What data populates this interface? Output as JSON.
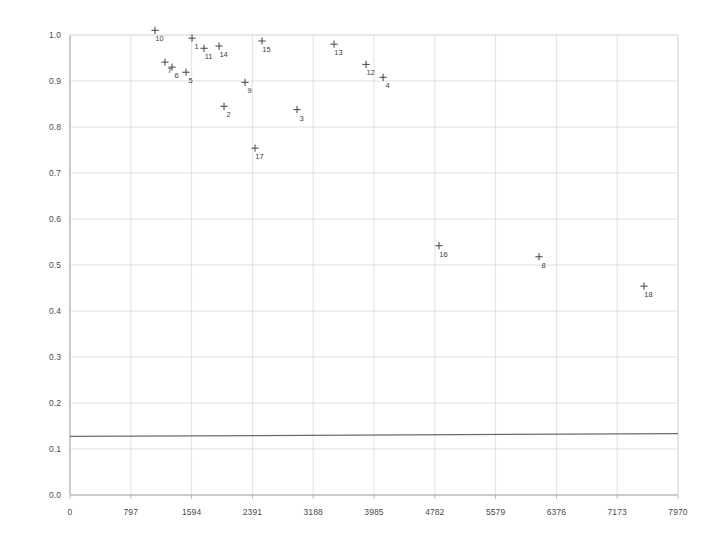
{
  "chart_data": {
    "type": "scatter",
    "title": "",
    "subtitle": "",
    "xlabel": "",
    "ylabel": "",
    "xlim": [
      0,
      7970
    ],
    "ylim": [
      0.0,
      1.0
    ],
    "xticks": [
      0,
      797,
      1594,
      2391,
      3188,
      3985,
      4782,
      5579,
      6376,
      7173,
      7970
    ],
    "xtick_labels": [
      "0",
      "797",
      "1594",
      "2391",
      "3188",
      "3985",
      "4782",
      "5579",
      "6376",
      "7173",
      "7970"
    ],
    "yticks": [
      0.0,
      0.1,
      0.2,
      0.3,
      0.4,
      0.5,
      0.6,
      0.7,
      0.8,
      0.9,
      1.0
    ],
    "ytick_labels": [
      "0.0",
      "0.1",
      "0.2",
      "0.3",
      "0.4",
      "0.5",
      "0.6",
      "0.7",
      "0.8",
      "0.9",
      "1.0"
    ],
    "grid": true,
    "legend": null,
    "marker": "plus",
    "marker_color": "#555555",
    "points": [
      {
        "label": "10",
        "x": 1114,
        "y": 1.01
      },
      {
        "label": "1",
        "x": 1600,
        "y": 0.993
      },
      {
        "label": "11",
        "x": 1757,
        "y": 0.971
      },
      {
        "label": "14",
        "x": 1954,
        "y": 0.976
      },
      {
        "label": "7",
        "x": 1245,
        "y": 0.941
      },
      {
        "label": "6",
        "x": 1337,
        "y": 0.93
      },
      {
        "label": "5",
        "x": 1521,
        "y": 0.919
      },
      {
        "label": "9",
        "x": 2294,
        "y": 0.897
      },
      {
        "label": "2",
        "x": 2019,
        "y": 0.845
      },
      {
        "label": "15",
        "x": 2517,
        "y": 0.987
      },
      {
        "label": "13",
        "x": 3461,
        "y": 0.98
      },
      {
        "label": "12",
        "x": 3881,
        "y": 0.936
      },
      {
        "label": "4",
        "x": 4104,
        "y": 0.908
      },
      {
        "label": "3",
        "x": 2976,
        "y": 0.838
      },
      {
        "label": "17",
        "x": 2425,
        "y": 0.754
      },
      {
        "label": "16",
        "x": 4837,
        "y": 0.542
      },
      {
        "label": "8",
        "x": 6148,
        "y": 0.518
      },
      {
        "label": "18",
        "x": 7524,
        "y": 0.454
      }
    ],
    "reference_line": {
      "name": "baseline",
      "x": [
        0,
        7970
      ],
      "y": [
        0.1275,
        0.1335
      ],
      "color": "#6b6b6b"
    }
  }
}
